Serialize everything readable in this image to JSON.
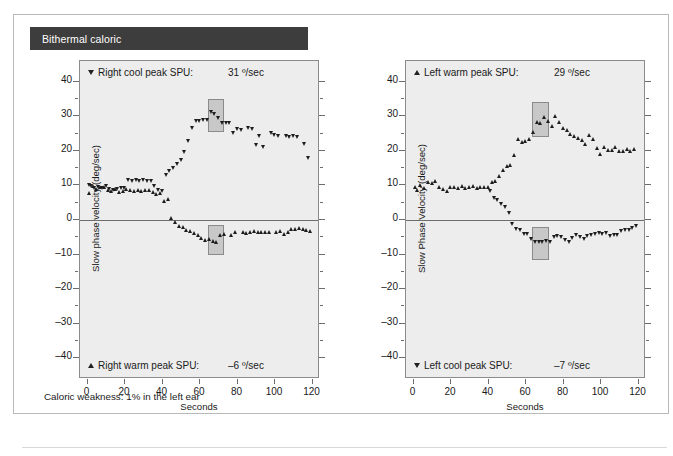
{
  "header": {
    "title": "Bithermal caloric",
    "title_bg": "#3d3d3d",
    "title_color": "#ffffff"
  },
  "footnote": "Caloric weakness: 1% in the left ear",
  "palette": {
    "plot_background": "#ededed",
    "axis": "#6d6d6d",
    "marker": "#1d1d1d",
    "highlight_fill": "#969696",
    "frame": "#b9b9b9"
  },
  "chart_data": [
    {
      "id": "right-ear",
      "type": "scatter",
      "title": "",
      "xlabel": "Seconds",
      "ylabel": "Slow phase velocity (deg/sec)",
      "xlim": [
        -4,
        124
      ],
      "ylim": [
        -46,
        46
      ],
      "xticks": [
        0,
        20,
        40,
        60,
        80,
        100,
        120
      ],
      "yticks": [
        40,
        30,
        20,
        10,
        0,
        -10,
        -20,
        -30,
        -40
      ],
      "ytick_labels": [
        "40",
        "30",
        "20",
        "10",
        "0",
        "–10",
        "–20",
        "–30",
        "–40"
      ],
      "grid": false,
      "zero_line": true,
      "legend_position": "inside-top / inside-bottom",
      "annotations": [
        {
          "position": "top",
          "marker": "triangle-down",
          "label": "Right cool peak SPU:",
          "value": "31 º/sec"
        },
        {
          "position": "bottom",
          "marker": "triangle-up",
          "label": "Right warm peak SPU:",
          "value": "–6 º/sec"
        }
      ],
      "highlight_boxes": [
        {
          "x0": 64,
          "x1": 73,
          "y0": 25.5,
          "y1": 35.0
        },
        {
          "x0": 64,
          "x1": 73,
          "y0": -10.0,
          "y1": -1.5
        }
      ],
      "series": [
        {
          "name": "Right cool peak SPU",
          "marker": "triangle-down",
          "x": [
            1,
            2,
            4,
            6,
            8,
            10,
            12,
            14,
            16,
            18,
            20,
            22,
            24,
            26,
            28,
            30,
            32,
            34,
            36,
            38,
            40,
            42,
            44,
            46,
            48,
            50,
            52,
            54,
            56,
            58,
            60,
            62,
            64,
            66,
            68,
            70,
            72,
            74,
            76,
            78,
            80,
            82,
            86,
            88,
            90,
            92,
            94,
            98,
            100,
            102,
            106,
            108,
            110,
            112,
            116,
            118
          ],
          "y": [
            10.2,
            9.7,
            9.1,
            9.6,
            9.3,
            9.7,
            9.0,
            8.6,
            8.9,
            9.1,
            9.2,
            11.4,
            11.3,
            11.6,
            11.2,
            11.5,
            11.1,
            11.3,
            9.8,
            8.5,
            8.4,
            13.0,
            14.2,
            15.0,
            16.2,
            17.4,
            19.5,
            22.7,
            26.6,
            28.5,
            28.7,
            28.9,
            29.0,
            31.1,
            30.6,
            29.5,
            28.1,
            28.0,
            28.1,
            25.2,
            26.3,
            25.9,
            26.6,
            26.4,
            21.5,
            24.3,
            21.2,
            25.2,
            24.5,
            24.2,
            24.2,
            24.1,
            24.2,
            24.1,
            22.0,
            17.8
          ]
        },
        {
          "name": "Right warm peak SPU",
          "marker": "triangle-up",
          "x": [
            1,
            3,
            5,
            7,
            9,
            11,
            13,
            15,
            17,
            19,
            21,
            23,
            25,
            27,
            29,
            31,
            33,
            35,
            37,
            39,
            41,
            43,
            45,
            47,
            49,
            51,
            53,
            55,
            57,
            59,
            61,
            63,
            65,
            67,
            69,
            71,
            73,
            77,
            79,
            83,
            85,
            87,
            89,
            91,
            93,
            95,
            97,
            101,
            103,
            105,
            107,
            109,
            111,
            113,
            115,
            117,
            119
          ],
          "y": [
            7.9,
            9.9,
            9.0,
            9.4,
            9.6,
            8.5,
            8.3,
            8.8,
            8.1,
            8.3,
            9.0,
            8.7,
            8.4,
            8.5,
            8.4,
            8.5,
            8.7,
            8.0,
            7.6,
            7.8,
            5.5,
            6.0,
            0.6,
            -0.6,
            -1.8,
            -2.2,
            -3.0,
            -3.3,
            -3.9,
            -4.4,
            -5.3,
            -5.9,
            -5.6,
            -6.2,
            -6.4,
            -4.4,
            -4.1,
            -4.3,
            -3.6,
            -3.5,
            -3.7,
            -3.4,
            -3.3,
            -3.6,
            -3.5,
            -3.4,
            -3.4,
            -3.5,
            -3.1,
            -4.2,
            -3.6,
            -2.6,
            -2.8,
            -2.5,
            -2.7,
            -3.0,
            -3.1
          ]
        }
      ]
    },
    {
      "id": "left-ear",
      "type": "scatter",
      "title": "",
      "xlabel": "Seconds",
      "ylabel": "Slow Phase Velocity (deg/sec)",
      "xlim": [
        -4,
        124
      ],
      "ylim": [
        -46,
        46
      ],
      "xticks": [
        0,
        20,
        40,
        60,
        80,
        100,
        120
      ],
      "yticks": [
        40,
        30,
        20,
        10,
        0,
        -10,
        -20,
        -30,
        -40
      ],
      "ytick_labels": [
        "40",
        "30",
        "20",
        "10",
        "0",
        "–10",
        "–20",
        "–30",
        "–40"
      ],
      "grid": false,
      "zero_line": true,
      "legend_position": "inside-top / inside-bottom",
      "annotations": [
        {
          "position": "top",
          "marker": "triangle-up",
          "label": "Left warm peak SPU:",
          "value": "29 º/sec"
        },
        {
          "position": "bottom",
          "marker": "triangle-down",
          "label": "Left cool peak SPU:",
          "value": "–7 º/sec"
        }
      ],
      "highlight_boxes": [
        {
          "x0": 63,
          "x1": 72,
          "y0": 24.0,
          "y1": 34.0
        },
        {
          "x0": 63,
          "x1": 72,
          "y0": -11.5,
          "y1": -2.0
        }
      ],
      "series": [
        {
          "name": "Left warm peak SPU",
          "marker": "triangle-up",
          "x": [
            1,
            2,
            4,
            6,
            8,
            10,
            12,
            14,
            16,
            18,
            20,
            22,
            24,
            26,
            28,
            30,
            32,
            34,
            36,
            38,
            40,
            42,
            44,
            46,
            48,
            50,
            52,
            54,
            56,
            58,
            60,
            62,
            64,
            66,
            68,
            70,
            72,
            74,
            76,
            78,
            80,
            82,
            84,
            86,
            88,
            90,
            92,
            94,
            96,
            98,
            100,
            102,
            104,
            106,
            108,
            110,
            112,
            114,
            116,
            118
          ],
          "y": [
            9.5,
            8.7,
            10.0,
            9.3,
            11.0,
            10.6,
            11.2,
            9.4,
            9.0,
            8.2,
            9.6,
            9.4,
            9.2,
            9.8,
            9.2,
            9.6,
            9.8,
            9.1,
            9.4,
            9.5,
            9.6,
            10.8,
            11.2,
            12.8,
            14.3,
            15.7,
            16.0,
            18.8,
            23.3,
            22.4,
            22.8,
            23.4,
            25.5,
            28.2,
            28.0,
            29.8,
            28.5,
            27.0,
            30.0,
            28.2,
            26.5,
            26.0,
            24.8,
            24.2,
            23.6,
            23.2,
            22.0,
            24.4,
            23.4,
            20.8,
            19.1,
            21.0,
            20.2,
            20.1,
            21.0,
            19.9,
            19.8,
            20.4,
            20.0,
            20.5
          ]
        },
        {
          "name": "Left cool peak SPU",
          "marker": "triangle-down",
          "x": [
            41,
            43,
            45,
            47,
            49,
            51,
            53,
            55,
            57,
            59,
            61,
            63,
            65,
            67,
            69,
            71,
            73,
            75,
            77,
            79,
            81,
            83,
            85,
            87,
            89,
            91,
            93,
            95,
            97,
            99,
            101,
            103,
            105,
            107,
            109,
            111,
            113,
            115,
            117,
            119
          ],
          "y": [
            8.2,
            6.4,
            5.6,
            4.5,
            3.8,
            2.0,
            -1.3,
            -2.6,
            -3.0,
            -4.0,
            -4.2,
            -5.6,
            -6.3,
            -6.4,
            -6.3,
            -6.2,
            -6.4,
            -4.9,
            -4.6,
            -4.9,
            -5.8,
            -6.4,
            -5.2,
            -4.5,
            -5.0,
            -5.6,
            -4.6,
            -4.3,
            -4.0,
            -3.9,
            -4.2,
            -3.8,
            -4.8,
            -4.4,
            -4.5,
            -3.3,
            -3.0,
            -2.9,
            -2.4,
            -1.8
          ]
        }
      ]
    }
  ]
}
